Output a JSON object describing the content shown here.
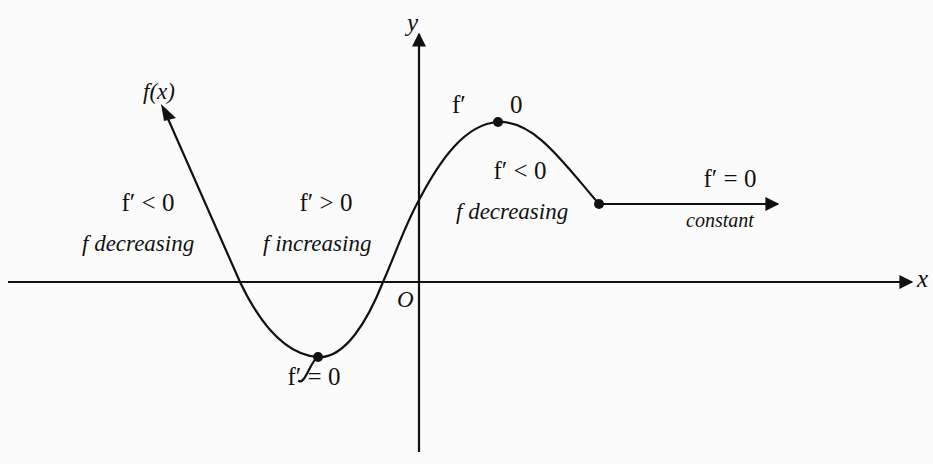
{
  "diagram": {
    "axes": {
      "x_label": "x",
      "y_label": "y",
      "origin_label": "O"
    },
    "curve_label": "f(x)",
    "regions": [
      {
        "id": "left-decreasing",
        "condition": "f′ < 0",
        "description": "f decreasing"
      },
      {
        "id": "increasing",
        "condition": "f′ > 0",
        "description": "f increasing"
      },
      {
        "id": "right-decreasing",
        "condition": "f′ < 0",
        "description": "f decreasing"
      },
      {
        "id": "constant",
        "condition": "f′ = 0",
        "description": "constant"
      }
    ],
    "critical_points": [
      {
        "id": "minimum",
        "label": "f′ = 0"
      },
      {
        "id": "maximum",
        "label_left": "f′",
        "label_right": "0"
      }
    ],
    "colors": {
      "stroke": "#111111",
      "background": "#fbfbfb"
    }
  }
}
